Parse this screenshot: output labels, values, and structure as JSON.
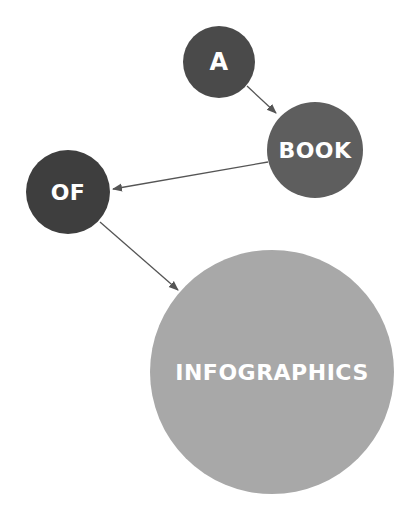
{
  "nodes": [
    {
      "id": "a",
      "label": "A",
      "cx": 219,
      "cy": 62,
      "r": 36,
      "color": "#4a4a4a",
      "font": 24
    },
    {
      "id": "book",
      "label": "BOOK",
      "cx": 315,
      "cy": 150,
      "r": 48,
      "color": "#5e5e5e",
      "font": 22
    },
    {
      "id": "of",
      "label": "OF",
      "cx": 68,
      "cy": 192,
      "r": 42,
      "color": "#3e3e3e",
      "font": 22
    },
    {
      "id": "infographics",
      "label": "INFOGRAPHICS",
      "cx": 272,
      "cy": 372,
      "r": 122,
      "color": "#a8a8a8",
      "font": 22
    }
  ],
  "edges": [
    {
      "from": "a",
      "to": "book",
      "x1": 247,
      "y1": 86,
      "x2": 276,
      "y2": 113
    },
    {
      "from": "book",
      "to": "of",
      "x1": 268,
      "y1": 162,
      "x2": 113,
      "y2": 189
    },
    {
      "from": "of",
      "to": "infographics",
      "x1": 100,
      "y1": 222,
      "x2": 178,
      "y2": 290
    }
  ],
  "colors": {
    "edge": "#555555",
    "background": "#ffffff"
  }
}
